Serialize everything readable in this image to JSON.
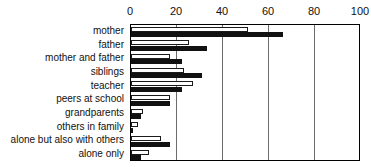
{
  "chart_data": {
    "type": "bar",
    "orientation": "horizontal",
    "title": "",
    "xlabel": "",
    "ylabel": "",
    "xlim": [
      0,
      100
    ],
    "xticks": [
      0,
      20,
      40,
      60,
      80,
      100
    ],
    "grid": true,
    "legend": "none",
    "categories": [
      "mother",
      "father",
      "mother and father",
      "siblings",
      "teacher",
      "peers at school",
      "grandparents",
      "others in family",
      "alone but also with others",
      "alone only"
    ],
    "series": [
      {
        "name": "open",
        "style": "white-outlined",
        "color": "#ffffff",
        "edge_color": "#1a1a1a",
        "values": [
          51,
          25,
          17,
          23,
          27,
          17,
          5,
          3,
          13,
          8
        ]
      },
      {
        "name": "solid",
        "style": "filled-black",
        "color": "#111111",
        "edge_color": "#111111",
        "values": [
          66,
          33,
          22,
          31,
          22,
          17,
          4.5,
          1,
          17,
          4.5
        ]
      }
    ]
  },
  "axis": {
    "tick_labels": [
      "0",
      "20",
      "40",
      "60",
      "80",
      "100"
    ]
  }
}
